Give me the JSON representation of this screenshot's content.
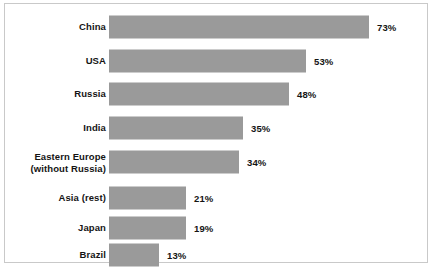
{
  "chart_data": {
    "type": "bar",
    "orientation": "horizontal",
    "title": "",
    "subtitle": "",
    "xlabel": "",
    "ylabel": "",
    "grid": false,
    "legend": false,
    "axis_visible": false,
    "value_suffix": "%",
    "xlim": [
      0,
      100
    ],
    "categories": [
      "China",
      "USA",
      "Russia",
      "India",
      "Eastern Europe\n(without Russia)",
      "Asia (rest)",
      "Japan",
      "Brazil"
    ],
    "values": [
      73,
      53,
      48,
      35,
      34,
      21,
      19,
      13
    ],
    "value_labels": [
      "73%",
      "53%",
      "48%",
      "35%",
      "34%",
      "21%",
      "19%",
      "13%"
    ],
    "series": [
      {
        "name": "Share",
        "values": [
          73,
          53,
          48,
          35,
          34,
          21,
          19,
          13
        ]
      }
    ]
  },
  "style": {
    "bar_color": "#9a9a9a",
    "text_color": "#141414",
    "background_color": "#ffffff",
    "border_color": "#c9c9c9"
  },
  "layout": {
    "row_centers_px": [
      23,
      57,
      90,
      124,
      158,
      194,
      224,
      251
    ],
    "bar_widths_px": [
      260,
      197,
      180,
      134,
      130,
      77,
      77,
      50
    ],
    "bar_height_px": 23,
    "bar_origin_px": 104,
    "value_gap_px": 8
  }
}
